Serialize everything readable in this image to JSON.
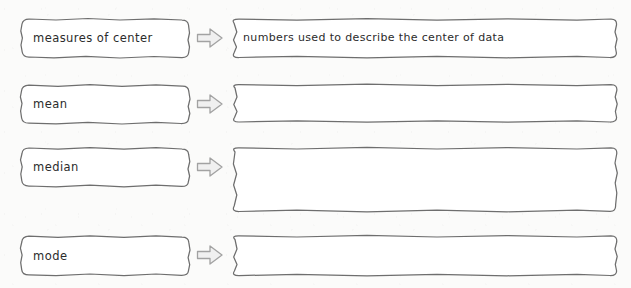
{
  "worksheet": {
    "title": "measures of center vocabulary organizer",
    "background_color": "#fbfbfa",
    "ink_color": "#2b2b2b",
    "box_border_color": "#6e6e6e",
    "box_fill_color": "#ffffff",
    "arrow_fill_color": "#f2f2f2",
    "arrow_border_color": "#a0a0a0",
    "arrow_icon_name": "right-arrow-icon",
    "rows": [
      {
        "term": "measures of center",
        "definition": "numbers used to describe the center of data",
        "definition_filled": true,
        "term_box_placeholder": "term",
        "definition_box_placeholder": "definition"
      },
      {
        "term": "mean",
        "definition": "",
        "definition_filled": false,
        "term_box_placeholder": "term",
        "definition_box_placeholder": "definition"
      },
      {
        "term": "median",
        "definition": "",
        "definition_filled": false,
        "term_box_placeholder": "term",
        "definition_box_placeholder": "definition"
      },
      {
        "term": "mode",
        "definition": "",
        "definition_filled": false,
        "term_box_placeholder": "term",
        "definition_box_placeholder": "definition"
      }
    ]
  }
}
